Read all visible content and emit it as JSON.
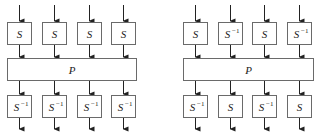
{
  "diagrams": [
    {
      "name": "left",
      "top_row": [
        "S",
        "S",
        "S",
        "S"
      ],
      "middle": "P",
      "bottom_row": [
        "S^-1",
        "S^-1",
        "S^-1",
        "S^-1"
      ],
      "x_cols": [
        7,
        42,
        77,
        111
      ],
      "p_x": 7,
      "p_w": 129
    },
    {
      "name": "right",
      "top_row": [
        "S",
        "S^-1",
        "S",
        "S^-1"
      ],
      "middle": "P",
      "bottom_row": [
        "S^-1",
        "S",
        "S^-1",
        "S"
      ],
      "x_cols": [
        183,
        218,
        252,
        287
      ],
      "p_x": 183,
      "p_w": 130
    }
  ],
  "labels": {
    "S": "S",
    "P": "P",
    "inv": "−1"
  },
  "colors": {
    "box_stroke": "#6a6a6a",
    "line": "#222222"
  }
}
